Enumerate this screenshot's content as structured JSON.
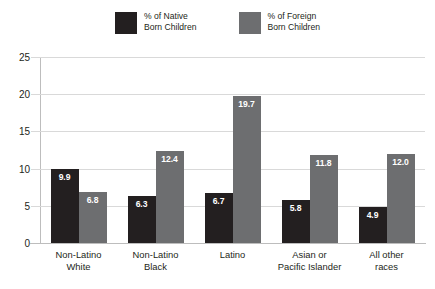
{
  "chart_data": {
    "type": "bar",
    "title": "",
    "xlabel": "",
    "ylabel": "",
    "ylim": [
      0,
      25
    ],
    "yticks": [
      "0",
      "5",
      "10",
      "15",
      "20",
      "25"
    ],
    "grid": true,
    "legend_position": "top-center",
    "categories": [
      "Non-Latino\nWhite",
      "Non-Latino\nBlack",
      "Latino",
      "Asian or\nPacific Islander",
      "All other\nraces"
    ],
    "series": [
      {
        "name": "% of Native\nBorn Children",
        "color": "#231f20",
        "values": [
          9.9,
          6.3,
          6.7,
          5.8,
          4.9
        ],
        "labels": [
          "9.9",
          "6.3",
          "6.7",
          "5.8",
          "4.9"
        ]
      },
      {
        "name": "% of Foreign\nBorn Children",
        "color": "#6d6e70",
        "values": [
          6.8,
          12.4,
          19.7,
          11.8,
          12.0
        ],
        "labels": [
          "6.8",
          "12.4",
          "19.7",
          "11.8",
          "12.0"
        ]
      }
    ]
  },
  "colors": {
    "native": "#231f20",
    "foreign": "#6d6e70",
    "gridline": "#d9d9d9",
    "axis": "#bdbdbd",
    "background": "#ffffff",
    "value_label": "#ffffff"
  }
}
